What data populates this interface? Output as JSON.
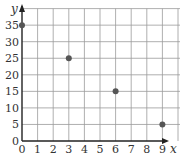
{
  "chart_data": {
    "type": "scatter",
    "title": "",
    "xlabel": "x",
    "ylabel": "y",
    "xlim": [
      0,
      10
    ],
    "ylim": [
      0,
      40
    ],
    "grid": true,
    "legend": null,
    "x_ticks": [
      "0",
      "1",
      "2",
      "3",
      "4",
      "5",
      "6",
      "7",
      "8",
      "9"
    ],
    "y_ticks": [
      "0",
      "5",
      "10",
      "15",
      "20",
      "25",
      "30",
      "35"
    ],
    "points": [
      {
        "x": 0,
        "y": 35
      },
      {
        "x": 3,
        "y": 25
      },
      {
        "x": 6,
        "y": 15
      },
      {
        "x": 9,
        "y": 5
      }
    ],
    "colors": {
      "grid": "#9a9a9a",
      "axis": "#222222",
      "point": "#555555"
    }
  }
}
